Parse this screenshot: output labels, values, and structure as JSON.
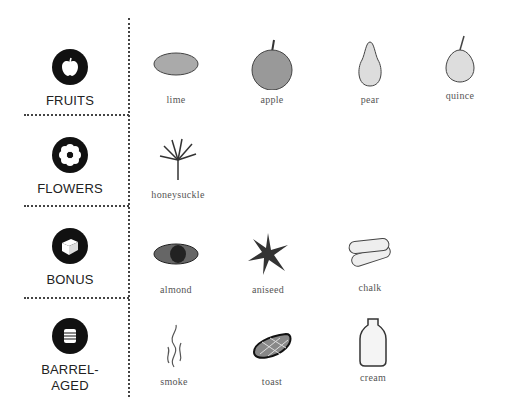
{
  "categories": [
    {
      "id": "fruits",
      "label": "FRUITS",
      "icon": "apple-icon",
      "items": [
        {
          "name": "lime",
          "icon": "lime-icon"
        },
        {
          "name": "apple",
          "icon": "apple-icon"
        },
        {
          "name": "pear",
          "icon": "pear-icon"
        },
        {
          "name": "quince",
          "icon": "quince-icon"
        }
      ]
    },
    {
      "id": "flowers",
      "label": "FLOWERS",
      "icon": "flower-icon",
      "items": [
        {
          "name": "honeysuckle",
          "icon": "honeysuckle-icon"
        }
      ]
    },
    {
      "id": "bonus",
      "label": "BONUS",
      "icon": "box-icon",
      "items": [
        {
          "name": "almond",
          "icon": "almond-icon"
        },
        {
          "name": "aniseed",
          "icon": "star-anise-icon"
        },
        {
          "name": "chalk",
          "icon": "chalk-icon"
        }
      ]
    },
    {
      "id": "barrel-aged",
      "label": "BARREL-\nAGED",
      "label_line1": "BARREL-",
      "label_line2": "AGED",
      "icon": "barrel-icon",
      "items": [
        {
          "name": "smoke",
          "icon": "smoke-icon"
        },
        {
          "name": "toast",
          "icon": "toast-icon"
        },
        {
          "name": "cream",
          "icon": "cream-bottle-icon"
        }
      ]
    }
  ],
  "colors": {
    "badge": "#111111",
    "divider": "#444444",
    "text": "#555555"
  }
}
